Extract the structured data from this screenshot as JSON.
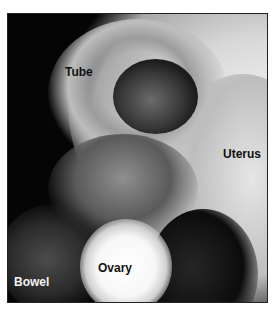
{
  "figure": {
    "type": "grayscale laparoscopic photograph",
    "labels": [
      {
        "text": "Tube",
        "color": "#111111"
      },
      {
        "text": "Uterus",
        "color": "#111111"
      },
      {
        "text": "Ovary",
        "color": "#111111"
      },
      {
        "text": "Bowel",
        "color": "#f2f2f2"
      }
    ]
  }
}
